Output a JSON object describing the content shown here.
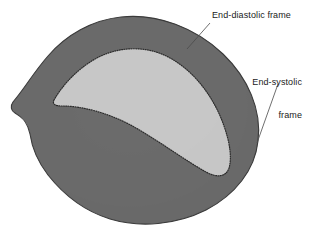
{
  "figure": {
    "type": "anatomical-diagram",
    "background_color": "#ffffff"
  },
  "annotations": [
    {
      "id": "end-diastolic",
      "text": "End-diastolic frame",
      "lines": [
        "End-diastolic frame"
      ],
      "align": "left",
      "text_color": "#1a1a1a",
      "leader_from": [
        210,
        23
      ],
      "leader_to": [
        187,
        49
      ]
    },
    {
      "id": "end-systolic",
      "text": "End-systolic frame",
      "lines": [
        "End-systolic",
        "frame"
      ],
      "align": "right",
      "text_color": "#1a1a1a",
      "leader_from": [
        278,
        84
      ],
      "leader_to": [
        257,
        143
      ]
    }
  ],
  "regions": {
    "myocardium": {
      "name": "Myocardial ring (end-diastolic region)",
      "fill_color": "#8b8b8b",
      "edge_color": "#3a3a3a",
      "texture": "mottled-speckle"
    },
    "cavity": {
      "name": "Ventricular cavity (end-systolic region)",
      "fill_color": "#cfcfcf",
      "edge_color": "#2b2b2b",
      "edge_style": "dotted",
      "texture": "fine-speckle"
    }
  },
  "leader_line": {
    "color": "#4a4a4a",
    "width": 0.8
  }
}
